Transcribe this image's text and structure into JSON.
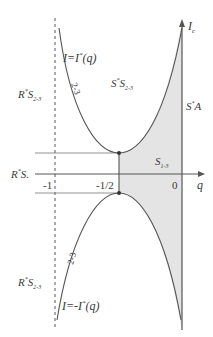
{
  "diagram": {
    "axes": {
      "x_label": "q",
      "y_label_main": "I",
      "y_label_sub": "c",
      "ticks": [
        {
          "label": "-1",
          "q": -1
        },
        {
          "label": "-1/2",
          "q": -0.5
        },
        {
          "label": "0",
          "q": 0
        }
      ]
    },
    "curves": {
      "upper": {
        "equation": "I=I*(q)",
        "eq_main": "I=I",
        "eq_sup": "*",
        "eq_arg": "(q)",
        "branch": "2-3"
      },
      "lower": {
        "equation": "I=-I*(q)",
        "eq_main": "I=-I",
        "eq_sup": "*",
        "eq_arg": "(q)",
        "branch": "2-3"
      }
    },
    "regions": {
      "r_s23_upper": {
        "main": "R",
        "sup": "*",
        "s": "S",
        "sub": "2-3"
      },
      "s_s23": {
        "main": "S",
        "sup": "*",
        "s": "S",
        "sub": "2-3"
      },
      "s_a": {
        "main": "S",
        "sup": "*",
        "s": "A"
      },
      "s13": {
        "s": "S",
        "sub": "1-3"
      },
      "r_s": {
        "main": "R",
        "sup": "*",
        "s": "S."
      },
      "r_s23_lower": {
        "main": "R",
        "sup": "*",
        "s": "S",
        "sub": "2-3"
      }
    },
    "colors": {
      "line": "#555555",
      "shade": "#e4e4e4",
      "text": "#3a3a3a"
    }
  }
}
